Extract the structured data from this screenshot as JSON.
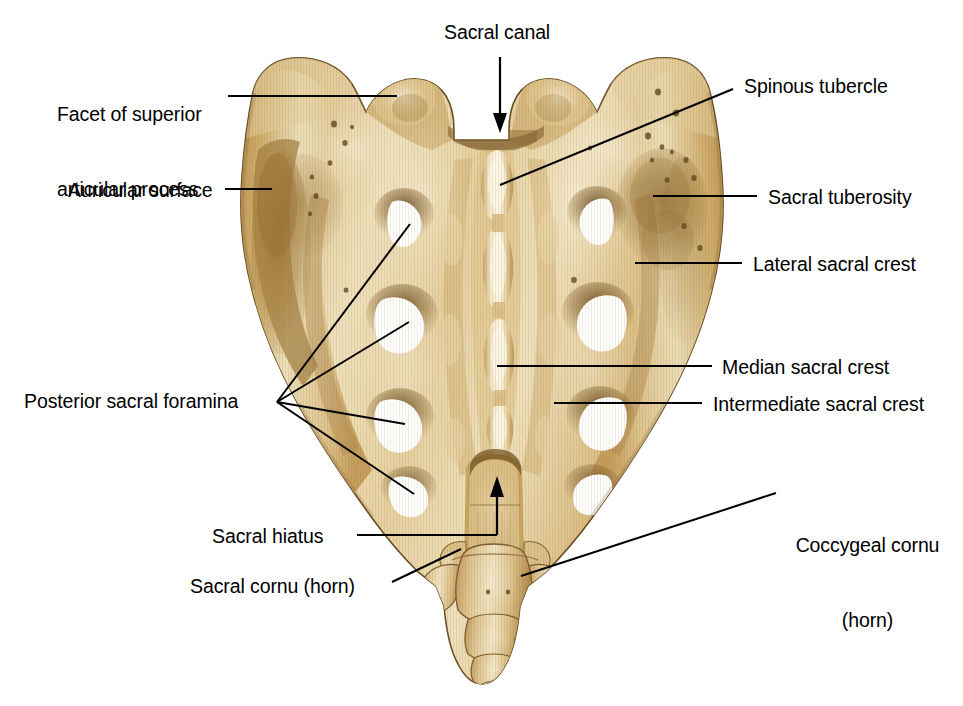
{
  "figure": {
    "background_color": "#ffffff",
    "width": 963,
    "height": 706
  },
  "palette": {
    "bone_light": "#f0e0bc",
    "bone_mid": "#dcbf86",
    "bone_base": "#d4b375",
    "bone_shadow": "#a98449",
    "bone_deep_shadow": "#7d5c2c",
    "bone_edge": "#6b4f24",
    "foramen_white": "#ffffff",
    "leader_line": "#000000",
    "text": "#000000"
  },
  "labels": [
    {
      "id": "facet-superior-articular-process",
      "text": "Facet of superior\narticular process",
      "lines": [
        "Facet of superior",
        "articular process"
      ],
      "x": 57,
      "y": 52,
      "align": "left",
      "leader": {
        "type": "line",
        "points": "228,96 397,96"
      }
    },
    {
      "id": "auricular-surface",
      "text": "Auricular surface",
      "lines": [
        "Auricular surface"
      ],
      "x": 68,
      "y": 178,
      "align": "left",
      "leader": {
        "type": "line",
        "points": "225,189 272,189"
      }
    },
    {
      "id": "sacral-canal",
      "text": "Sacral canal",
      "lines": [
        "Sacral canal"
      ],
      "x": 444,
      "y": 20,
      "align": "left",
      "leader": {
        "type": "arrow",
        "points": "500,57 500,128"
      }
    },
    {
      "id": "spinous-tubercle",
      "text": "Spinous tubercle",
      "lines": [
        "Spinous tubercle"
      ],
      "x": 744,
      "y": 74,
      "align": "left",
      "leader": {
        "type": "line",
        "points": "500,185 733,89"
      }
    },
    {
      "id": "sacral-tuberosity",
      "text": "Sacral tuberosity",
      "lines": [
        "Sacral tuberosity"
      ],
      "x": 768,
      "y": 185,
      "align": "left",
      "leader": {
        "type": "line",
        "points": "653,196 757,196"
      }
    },
    {
      "id": "lateral-sacral-crest",
      "text": "Lateral sacral crest",
      "lines": [
        "Lateral sacral crest"
      ],
      "x": 753,
      "y": 252,
      "align": "left",
      "leader": {
        "type": "line",
        "points": "635,263 742,263"
      }
    },
    {
      "id": "median-sacral-crest",
      "text": "Median sacral crest",
      "lines": [
        "Median sacral crest"
      ],
      "x": 722,
      "y": 355,
      "align": "left",
      "leader": {
        "type": "line",
        "points": "497,366 712,366"
      }
    },
    {
      "id": "intermediate-sacral-crest",
      "text": "Intermediate sacral crest",
      "lines": [
        "Intermediate sacral crest"
      ],
      "x": 713,
      "y": 392,
      "align": "left",
      "leader": {
        "type": "line",
        "points": "554,403 702,403"
      }
    },
    {
      "id": "posterior-sacral-foramina",
      "text": "Posterior sacral foramina",
      "lines": [
        "Posterior sacral foramina"
      ],
      "x": 24,
      "y": 389,
      "align": "left",
      "leader": {
        "type": "multi",
        "hub": "277,402",
        "targets": [
          "410,224",
          "409,322",
          "405,424",
          "414,494"
        ]
      }
    },
    {
      "id": "sacral-hiatus",
      "text": "Sacral hiatus",
      "lines": [
        "Sacral hiatus"
      ],
      "x": 212,
      "y": 524,
      "align": "left",
      "leader": {
        "type": "line",
        "points": "357,535 497,535"
      }
    },
    {
      "id": "sacral-cornu-horn",
      "text": "Sacral cornu (horn)",
      "lines": [
        "Sacral cornu (horn)"
      ],
      "x": 190,
      "y": 574,
      "align": "left",
      "leader": {
        "type": "line",
        "points": "392,582 461,549"
      }
    },
    {
      "id": "coccygeal-cornu-horn",
      "text": "Coccygeal cornu\n(horn)",
      "lines": [
        "Coccygeal cornu",
        "(horn)"
      ],
      "x": 785,
      "y": 483,
      "align": "left",
      "leader": {
        "type": "line",
        "points": "521,576 776,493"
      }
    }
  ],
  "anatomy": {
    "foramina_count": 8,
    "posterior_foramina_left": [
      {
        "cx": 404,
        "cy": 222,
        "rx": 18,
        "ry": 21
      },
      {
        "cx": 402,
        "cy": 323,
        "rx": 24,
        "ry": 25
      },
      {
        "cx": 400,
        "cy": 424,
        "rx": 24,
        "ry": 23
      },
      {
        "cx": 409,
        "cy": 496,
        "rx": 20,
        "ry": 18
      }
    ],
    "posterior_foramina_right": [
      {
        "cx": 597,
        "cy": 220,
        "rx": 18,
        "ry": 21
      },
      {
        "cx": 598,
        "cy": 321,
        "rx": 24,
        "ry": 25
      },
      {
        "cx": 600,
        "cy": 422,
        "rx": 24,
        "ry": 23
      },
      {
        "cx": 592,
        "cy": 494,
        "rx": 20,
        "ry": 18
      }
    ],
    "coccyx_segments": 4
  }
}
